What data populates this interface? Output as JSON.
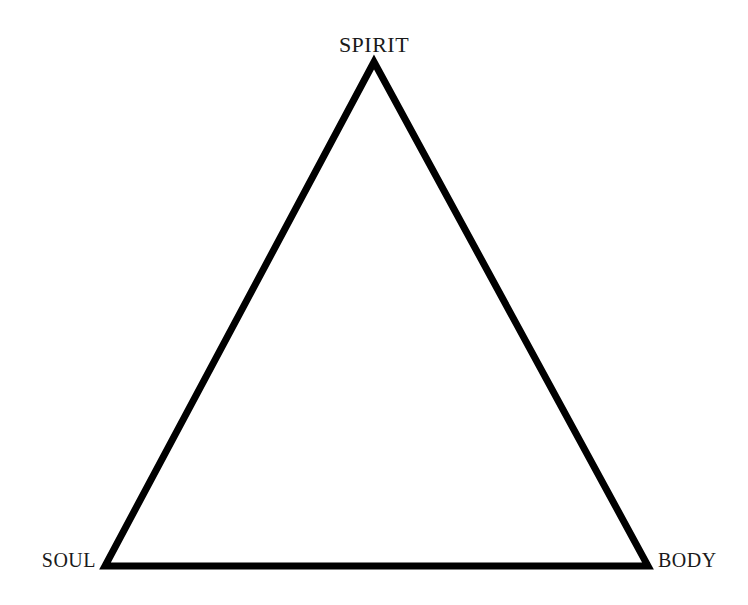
{
  "diagram": {
    "type": "triangle-diagram",
    "background_color": "#ffffff",
    "stroke_color": "#000000",
    "stroke_width": 7,
    "text_color": "#1a1a1a",
    "canvas": {
      "width": 748,
      "height": 605
    },
    "shape": {
      "name": "triangle",
      "closed": true,
      "points": [
        {
          "id": "apex",
          "x": 374,
          "y": 62
        },
        {
          "id": "bottom-right",
          "x": 648,
          "y": 566
        },
        {
          "id": "bottom-left",
          "x": 105,
          "y": 566
        }
      ],
      "path": "M 374 62 L 648 566 L 105 566 Z"
    },
    "vertices": [
      {
        "id": "spirit",
        "label": "SPIRIT",
        "position": "top",
        "anchor_x": 374,
        "anchor_y": 62,
        "font_size": 22
      },
      {
        "id": "soul",
        "label": "SOUL",
        "position": "bottom-left",
        "anchor_x": 105,
        "anchor_y": 566,
        "font_size": 20
      },
      {
        "id": "body",
        "label": "BODY",
        "position": "bottom-right",
        "anchor_x": 648,
        "anchor_y": 566,
        "font_size": 20
      }
    ]
  }
}
